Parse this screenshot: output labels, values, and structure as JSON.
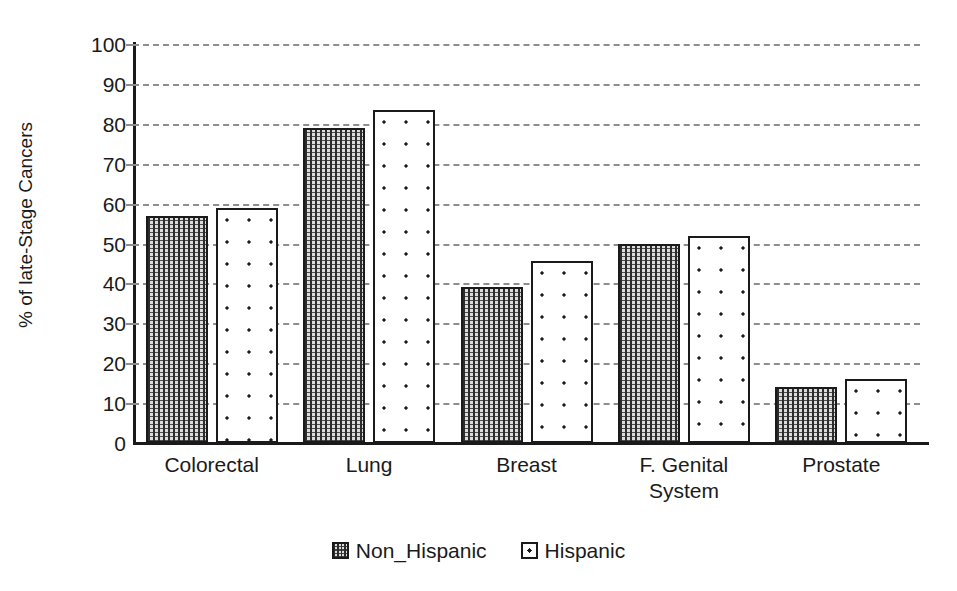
{
  "chart_data": {
    "type": "bar",
    "title": "",
    "xlabel": "",
    "ylabel": "% of late-Stage Cancers",
    "ylim": [
      0,
      100
    ],
    "ytick_step": 10,
    "yticks": [
      100,
      90,
      80,
      70,
      60,
      50,
      40,
      30,
      20,
      10,
      0
    ],
    "grid": true,
    "grid_style": "dashed-horizontal",
    "legend_position": "bottom-center",
    "categories": [
      "Colorectal",
      "Lung",
      "Breast",
      "F. Genital\nSystem",
      "Prostate"
    ],
    "series": [
      {
        "name": "Non_Hispanic",
        "pattern": "dense-dotted-gray",
        "values": [
          57,
          79,
          39,
          50,
          14
        ]
      },
      {
        "name": "Hispanic",
        "pattern": "sparse-dots-white",
        "values": [
          59,
          83.5,
          45.5,
          52,
          16
        ]
      }
    ]
  },
  "legend": {
    "items": [
      {
        "label": "Non_Hispanic",
        "swatch": "dense-dotted-swatch"
      },
      {
        "label": "Hispanic",
        "swatch": "sparse-dots-swatch"
      }
    ]
  },
  "colors": {
    "axis": "#1a1a1a",
    "gridline": "#8e8e8e",
    "series_non_hispanic_fill": "#dcdcdc",
    "series_hispanic_fill": "#ffffff",
    "background": "#ffffff"
  }
}
